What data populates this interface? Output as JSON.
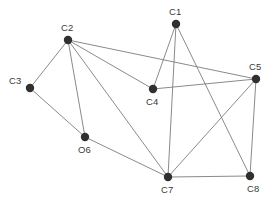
{
  "figure": {
    "type": "node-link-graph",
    "background_color": "#ffffff",
    "width": 273,
    "height": 205
  },
  "style": {
    "node_fill": "#332f2f",
    "node_radius": 4.2,
    "edge_color": "#7d7d7d",
    "edge_width": 0.9,
    "label_color": "#3a3a3a",
    "label_font_size": 9.5
  },
  "graph_data": {
    "type": "graph",
    "node_count": 8,
    "edge_count": 16,
    "nodes": [
      {
        "id": "C1",
        "label": "C1",
        "x": 176,
        "y": 24,
        "label_x": 169,
        "label_y": 7,
        "label_anchor": "above"
      },
      {
        "id": "C2",
        "label": "C2",
        "x": 68,
        "y": 40,
        "label_x": 61,
        "label_y": 23,
        "label_anchor": "above"
      },
      {
        "id": "C3",
        "label": "C3",
        "x": 30,
        "y": 88,
        "label_x": 9,
        "label_y": 76,
        "label_anchor": "left"
      },
      {
        "id": "C4",
        "label": "C4",
        "x": 153,
        "y": 89,
        "label_x": 146,
        "label_y": 97,
        "label_anchor": "below"
      },
      {
        "id": "C5",
        "label": "C5",
        "x": 256,
        "y": 79,
        "label_x": 249,
        "label_y": 62,
        "label_anchor": "above"
      },
      {
        "id": "O6",
        "label": "O6",
        "x": 85,
        "y": 137,
        "label_x": 78,
        "label_y": 145,
        "label_anchor": "below"
      },
      {
        "id": "C7",
        "label": "C7",
        "x": 168,
        "y": 177,
        "label_x": 161,
        "label_y": 185,
        "label_anchor": "below"
      },
      {
        "id": "C8",
        "label": "C8",
        "x": 250,
        "y": 176,
        "label_x": 247,
        "label_y": 184,
        "label_anchor": "below"
      }
    ],
    "edges": [
      {
        "source": "C1",
        "target": "C4"
      },
      {
        "source": "C1",
        "target": "C7"
      },
      {
        "source": "C1",
        "target": "C8"
      },
      {
        "source": "C2",
        "target": "C3"
      },
      {
        "source": "C2",
        "target": "C4"
      },
      {
        "source": "C2",
        "target": "C5"
      },
      {
        "source": "C2",
        "target": "O6"
      },
      {
        "source": "C2",
        "target": "C7"
      },
      {
        "source": "C3",
        "target": "O6"
      },
      {
        "source": "C4",
        "target": "C5"
      },
      {
        "source": "C5",
        "target": "C7"
      },
      {
        "source": "C5",
        "target": "C8"
      },
      {
        "source": "O6",
        "target": "C7"
      },
      {
        "source": "C7",
        "target": "C8"
      },
      {
        "source": "C2",
        "target": "C2b"
      },
      {
        "source": "C1",
        "target": "C1b"
      }
    ]
  }
}
